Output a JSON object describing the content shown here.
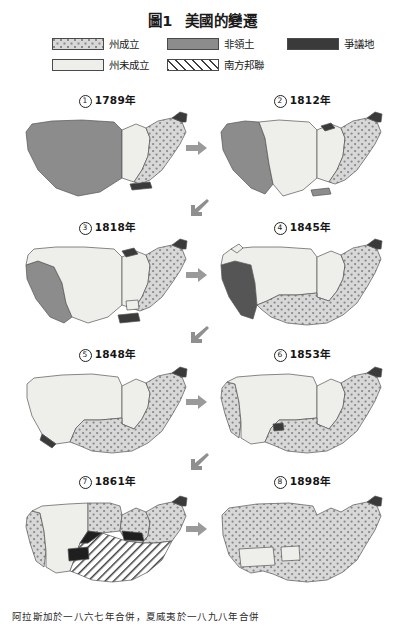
{
  "title": {
    "figure_number": "圖1",
    "text": "美國的變遷"
  },
  "legend": {
    "items": [
      {
        "label": "州成立",
        "pattern": "dotted",
        "color": "#d8d8d8"
      },
      {
        "label": "非領土",
        "pattern": "solid-gray",
        "color": "#8c8c8c"
      },
      {
        "label": "爭議地",
        "pattern": "solid-dark",
        "color": "#3a3a3a"
      },
      {
        "label": "州未成立",
        "pattern": "solid-light",
        "color": "#eeeeea"
      },
      {
        "label": "南方邦聯",
        "pattern": "hatched",
        "color": "#ffffff"
      }
    ]
  },
  "maps": [
    {
      "index": "1",
      "year": "1789年"
    },
    {
      "index": "2",
      "year": "1812年"
    },
    {
      "index": "3",
      "year": "1818年"
    },
    {
      "index": "4",
      "year": "1845年"
    },
    {
      "index": "5",
      "year": "1848年"
    },
    {
      "index": "6",
      "year": "1853年"
    },
    {
      "index": "7",
      "year": "1861年"
    },
    {
      "index": "8",
      "year": "1898年"
    }
  ],
  "arrows": {
    "right": "arrow-right-icon",
    "down_left": "arrow-down-left-icon"
  },
  "footnote": "阿拉斯加於一八六七年合併，夏威夷於一八九八年合併"
}
